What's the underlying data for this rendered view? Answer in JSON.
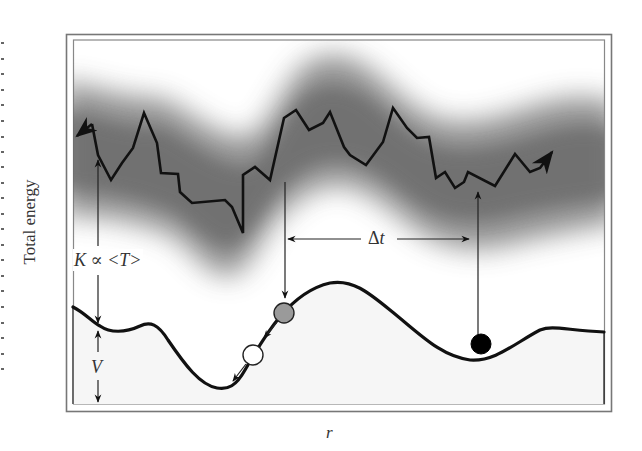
{
  "figure": {
    "type": "energy-landscape-schematic",
    "y_axis_label": "Total energy",
    "x_axis_label": "r",
    "annotations": {
      "kinetic": {
        "K": "K",
        "propto": "∝",
        "T": "<T>"
      },
      "potential": "V",
      "time_interval": {
        "delta": "Δ",
        "t": "t"
      }
    },
    "colors": {
      "line": "#111111",
      "frame": "#777777",
      "band": "#8a8a8a",
      "ball_grey": "#9a9a9a",
      "ball_white": "#ffffff",
      "ball_black": "#000000",
      "floor_fill": "#f7f7f7"
    },
    "trajectory_points": [
      [
        76,
        137
      ],
      [
        92,
        124
      ],
      [
        98,
        155
      ],
      [
        111,
        180
      ],
      [
        122,
        163
      ],
      [
        133,
        148
      ],
      [
        144,
        113
      ],
      [
        157,
        143
      ],
      [
        161,
        173
      ],
      [
        178,
        174
      ],
      [
        180,
        192
      ],
      [
        192,
        203
      ],
      [
        225,
        200
      ],
      [
        232,
        207
      ],
      [
        243,
        233
      ],
      [
        243,
        175
      ],
      [
        255,
        167
      ],
      [
        270,
        180
      ],
      [
        284,
        118
      ],
      [
        296,
        110
      ],
      [
        309,
        130
      ],
      [
        323,
        123
      ],
      [
        330,
        112
      ],
      [
        344,
        147
      ],
      [
        350,
        155
      ],
      [
        366,
        165
      ],
      [
        383,
        142
      ],
      [
        393,
        108
      ],
      [
        407,
        128
      ],
      [
        417,
        138
      ],
      [
        429,
        137
      ],
      [
        436,
        178
      ],
      [
        445,
        172
      ],
      [
        455,
        188
      ],
      [
        464,
        182
      ],
      [
        468,
        172
      ],
      [
        495,
        186
      ],
      [
        515,
        154
      ],
      [
        530,
        172
      ],
      [
        540,
        168
      ],
      [
        552,
        152
      ]
    ],
    "balls": [
      {
        "name": "grey",
        "cx": 284,
        "cy": 313,
        "r": 10
      },
      {
        "name": "white",
        "cx": 253,
        "cy": 355,
        "r": 10
      },
      {
        "name": "black",
        "cx": 481,
        "cy": 344,
        "r": 10
      }
    ]
  }
}
